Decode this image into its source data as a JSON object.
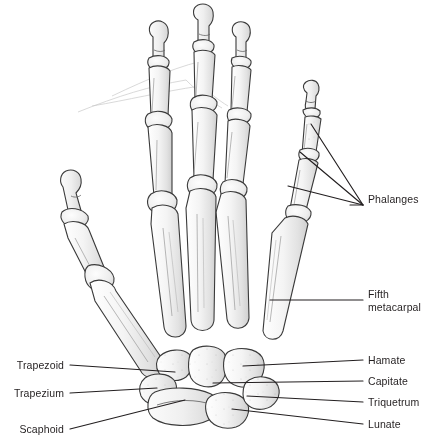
{
  "figure": {
    "view": "dorsal view of right hand skeleton",
    "style": {
      "bone_fill": "#f1f1f1",
      "bone_shade": "#d8d8d8",
      "outline": "#3a3a3a",
      "leader_line": "#231f20",
      "label_color": "#231f20",
      "background": "#ffffff",
      "faint_line": "#c9c9c9"
    }
  },
  "labels": {
    "right": [
      {
        "id": "phalanges",
        "line1": "Phalanges",
        "line2": "",
        "x": 368,
        "y": 199,
        "leader_end_x": 363,
        "leader_y": 205,
        "leaders": [
          {
            "x": 311,
            "y": 124
          },
          {
            "x": 300,
            "y": 152
          },
          {
            "x": 288,
            "y": 186
          }
        ]
      },
      {
        "id": "fifth-metacarpal",
        "line1": "Fifth",
        "line2": "metacarpal",
        "x": 368,
        "y": 294,
        "leader_end_x": 363,
        "leader_y": 300,
        "leaders": [
          {
            "x": 270,
            "y": 300
          }
        ]
      },
      {
        "id": "hamate",
        "line1": "Hamate",
        "line2": "",
        "x": 368,
        "y": 354,
        "leader_end_x": 363,
        "leader_y": 360,
        "leaders": [
          {
            "x": 243,
            "y": 366
          }
        ]
      },
      {
        "id": "capitate",
        "line1": "Capitate",
        "line2": "",
        "x": 368,
        "y": 375,
        "leader_end_x": 363,
        "leader_y": 381,
        "leaders": [
          {
            "x": 213,
            "y": 383
          }
        ]
      },
      {
        "id": "triquetrum",
        "line1": "Triquetrum",
        "line2": "",
        "x": 368,
        "y": 396,
        "leader_end_x": 363,
        "leader_y": 402,
        "leaders": [
          {
            "x": 247,
            "y": 396
          }
        ]
      },
      {
        "id": "lunate",
        "line1": "Lunate",
        "line2": "",
        "x": 368,
        "y": 418,
        "leader_end_x": 363,
        "leader_y": 424,
        "leaders": [
          {
            "x": 232,
            "y": 409
          }
        ]
      }
    ],
    "left": [
      {
        "id": "trapezoid",
        "line1": "Trapezoid",
        "x": 64,
        "y": 359,
        "leader_start_x": 70,
        "leader_y": 365,
        "leaders": [
          {
            "x": 175,
            "y": 372
          }
        ]
      },
      {
        "id": "trapezium",
        "line1": "Trapezium",
        "x": 64,
        "y": 387,
        "leader_start_x": 70,
        "leader_y": 393,
        "leaders": [
          {
            "x": 157,
            "y": 388
          }
        ]
      },
      {
        "id": "scaphoid",
        "line1": "Scaphoid",
        "x": 64,
        "y": 423,
        "leader_start_x": 70,
        "leader_y": 429,
        "leaders": [
          {
            "x": 185,
            "y": 400
          }
        ]
      }
    ]
  },
  "bones": {
    "digits": [
      {
        "name": "thumb",
        "segments": [
          "distal phalanx",
          "proximal phalanx",
          "first metacarpal"
        ]
      },
      {
        "name": "index finger",
        "segments": [
          "distal phalanx",
          "middle phalanx",
          "proximal phalanx",
          "second metacarpal"
        ]
      },
      {
        "name": "middle finger",
        "segments": [
          "distal phalanx",
          "middle phalanx",
          "proximal phalanx",
          "third metacarpal"
        ]
      },
      {
        "name": "ring finger",
        "segments": [
          "distal phalanx",
          "middle phalanx",
          "proximal phalanx",
          "fourth metacarpal"
        ]
      },
      {
        "name": "little finger",
        "segments": [
          "distal phalanx",
          "middle phalanx",
          "proximal phalanx",
          "fifth metacarpal"
        ]
      }
    ],
    "carpals": [
      "Scaphoid",
      "Lunate",
      "Triquetrum",
      "Trapezium",
      "Trapezoid",
      "Capitate",
      "Hamate"
    ]
  }
}
